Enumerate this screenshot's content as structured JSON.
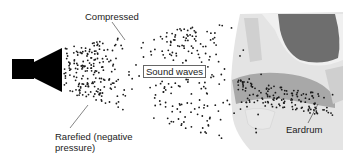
{
  "diagram": {
    "labels": {
      "compressed": "Compressed",
      "sound_waves": "Sound waves",
      "rarefied_line1": "Rarefied (negative",
      "rarefied_line2": "pressure)",
      "eardrum": "Eardrum"
    },
    "elements": [
      "speaker-icon",
      "sound-wave-particles",
      "ear-canal-cross-section"
    ],
    "colors": {
      "speaker": "#000000",
      "dots": "#1a1a1a",
      "ear_tissue": "#d9d9d9",
      "ear_cavity": "#6e6e6e",
      "ear_canal": "#a8a8a8"
    }
  }
}
